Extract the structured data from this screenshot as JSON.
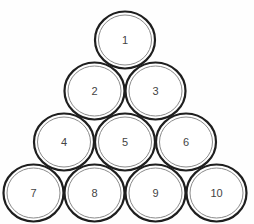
{
  "diagram": {
    "type": "triangular-arrangement",
    "rows": [
      {
        "row": 1,
        "circles": [
          "1"
        ]
      },
      {
        "row": 2,
        "circles": [
          "2",
          "3"
        ]
      },
      {
        "row": 3,
        "circles": [
          "4",
          "5",
          "6"
        ]
      },
      {
        "row": 4,
        "circles": [
          "7",
          "8",
          "9",
          "10"
        ]
      }
    ],
    "colors": {
      "outline": "#1e1e1e",
      "inner_ring": "#8a8a8a",
      "label": "#444444",
      "fill": "#ffffff"
    }
  }
}
